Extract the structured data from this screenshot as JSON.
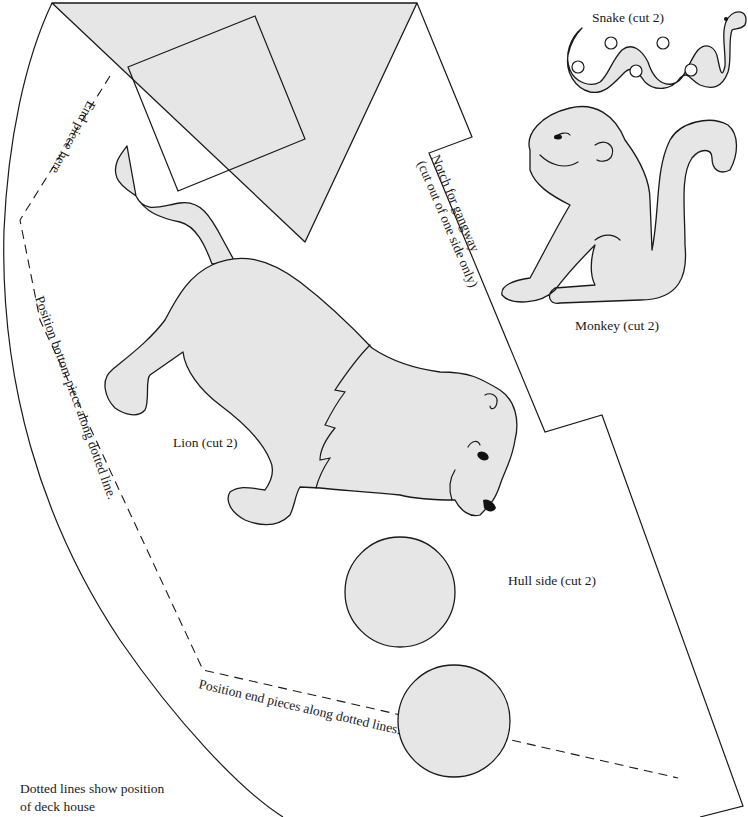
{
  "colors": {
    "piece_fill": "#e6e6e6",
    "line": "#1a1a1a",
    "background": "#ffffff"
  },
  "labels": {
    "snake": "Snake (cut 2)",
    "monkey": "Monkey (cut 2)",
    "lion": "Lion (cut 2)",
    "hull_side": "Hull side (cut 2)",
    "notch_line1": "Notch for gangway",
    "notch_line2": "(cut out of one side only)",
    "end_piece": "End piece here",
    "bottom_piece": "Position bottom piece along dotted line.",
    "end_pieces": "Position end pieces along dotted lines.",
    "deck_note_line1": "Dotted lines show position",
    "deck_note_line2": "of deck house"
  },
  "pieces": [
    {
      "name": "Snake",
      "cut": 2
    },
    {
      "name": "Monkey",
      "cut": 2
    },
    {
      "name": "Lion",
      "cut": 2
    },
    {
      "name": "Hull side",
      "cut": 2
    }
  ]
}
